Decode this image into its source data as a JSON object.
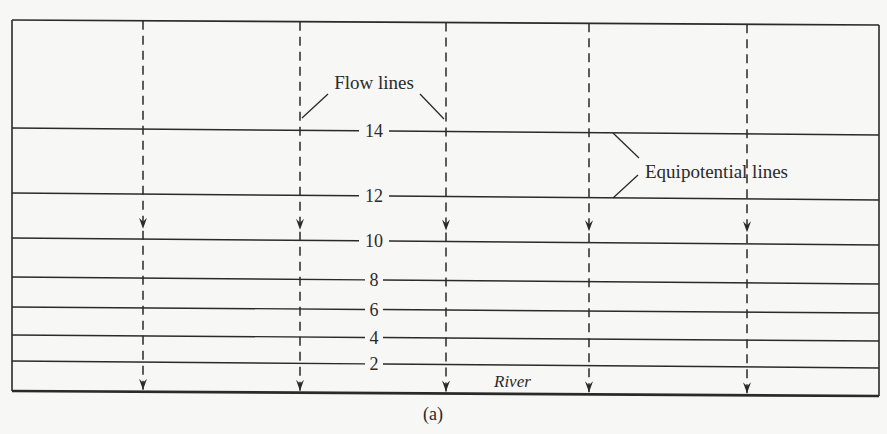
{
  "figure": {
    "caption": "(a)",
    "colors": {
      "ink": "#2a2a2a",
      "paper": "#f7f7f5"
    },
    "labels": {
      "flow_lines": "Flow lines",
      "equipotential_lines": "Equipotential lines",
      "river": "River"
    },
    "equipotential_lines": [
      {
        "value": "14",
        "y_left": 128,
        "y_right": 135
      },
      {
        "value": "12",
        "y_left": 193,
        "y_right": 200
      },
      {
        "value": "10",
        "y_left": 238,
        "y_right": 245
      },
      {
        "value": "8",
        "y_left": 277,
        "y_right": 284
      },
      {
        "value": "6",
        "y_left": 307,
        "y_right": 313
      },
      {
        "value": "4",
        "y_left": 335,
        "y_right": 341
      },
      {
        "value": "2",
        "y_left": 361,
        "y_right": 368
      }
    ],
    "flow_lines": [
      {
        "x": 143
      },
      {
        "x": 300
      },
      {
        "x": 446
      },
      {
        "x": 589
      },
      {
        "x": 747
      }
    ],
    "box": {
      "left": 12,
      "right": 879,
      "top_left": 20,
      "top_right": 25,
      "bottom_left": 391,
      "bottom_right": 396
    }
  }
}
